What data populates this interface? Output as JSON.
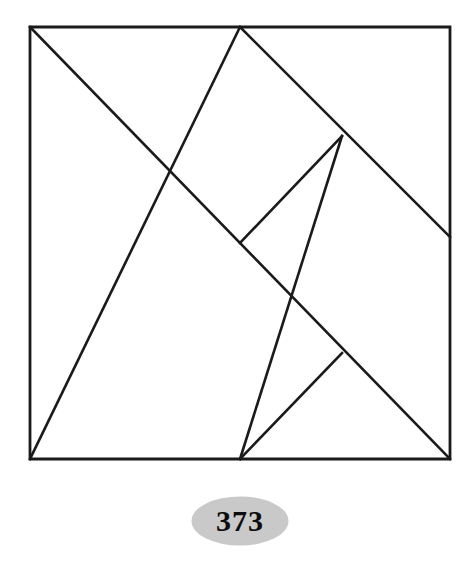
{
  "figure": {
    "name": "tangram-square-dissection",
    "kind": "tangram",
    "caption_label": "373",
    "background_color": "#ffffff",
    "stroke_color": "#1a1a1a",
    "stroke_width": 2.6,
    "outline_stroke_width": 2.8,
    "viewbox": "0 0 472 480",
    "square": {
      "left": 30,
      "top": 27,
      "right": 450,
      "bottom": 459,
      "width": 420,
      "height": 432
    },
    "vertices": {
      "top_left": [
        30,
        27
      ],
      "top_mid": [
        240,
        27
      ],
      "top_right": [
        450,
        27
      ],
      "right_mid": [
        450,
        237
      ],
      "bottom_right": [
        450,
        459
      ],
      "bottom_mid": [
        240,
        459
      ],
      "bottom_left": [
        30,
        459
      ],
      "center": [
        240,
        243
      ],
      "upper_knot": [
        342,
        136
      ],
      "lower_knot": [
        342,
        353
      ]
    },
    "outline_path": "M 30 27 L 450 27 L 450 459 L 30 459 Z",
    "cut_lines": [
      {
        "name": "diagonal-top-left-to-bottom-right",
        "from": [
          30,
          27
        ],
        "to": [
          450,
          459
        ],
        "path": "M 30 27 L 450 459"
      },
      {
        "name": "diagonal-top-mid-to-bottom-left",
        "from": [
          240,
          27
        ],
        "to": [
          30,
          459
        ],
        "path": "M 240 27 L 30 459"
      },
      {
        "name": "diagonal-top-mid-to-right-mid",
        "from": [
          240,
          27
        ],
        "to": [
          450,
          237
        ],
        "path": "M 240 27 L 450 237"
      },
      {
        "name": "diagonal-bottom-mid-to-upper-knot",
        "from": [
          240,
          459
        ],
        "to": [
          342,
          136
        ],
        "path": "M 240 459 L 342 136"
      },
      {
        "name": "short-cut-upper-knot",
        "from": [
          342,
          136
        ],
        "to": [
          240,
          243
        ],
        "path": "M 342 136 L 240 243"
      },
      {
        "name": "short-cut-lower-knot",
        "from": [
          342,
          353
        ],
        "to": [
          240,
          459
        ],
        "path": "M 342 353 L 240 459"
      }
    ]
  },
  "caption": {
    "badge_label": "373",
    "badge_fill_color": "#c9c9c9",
    "badge_text_color": "#0d0d0d",
    "badge_shape": "ellipse"
  }
}
